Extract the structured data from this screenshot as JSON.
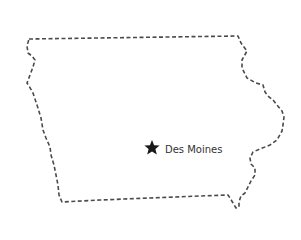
{
  "map": {
    "region": "Iowa",
    "outline_color": "#4a4a4a",
    "outline_style": "dashed",
    "background": "#ffffff",
    "capital": {
      "name": "Des Moines",
      "icon": "star-icon",
      "color": "#1a1a1a"
    }
  }
}
